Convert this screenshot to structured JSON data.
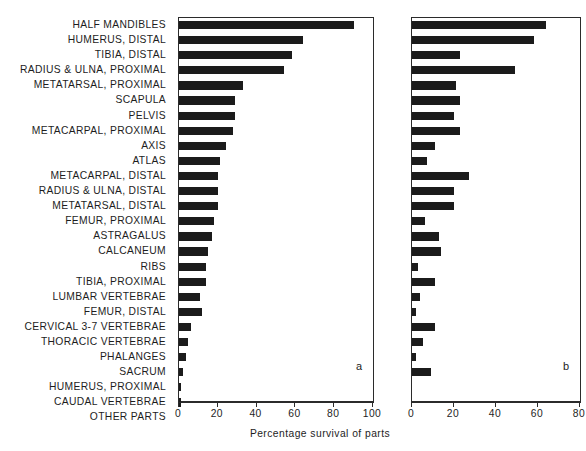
{
  "chart_data": {
    "type": "bar",
    "orientation": "horizontal",
    "title": "",
    "xlabel": "Percentage survival of parts",
    "ylabel": "",
    "grid": false,
    "legend": "none",
    "panels": [
      {
        "tag": "a",
        "xlim": [
          0,
          100
        ],
        "xticks": [
          0,
          20,
          40,
          60,
          80,
          100
        ],
        "xticklabels": [
          "0",
          "20",
          "40",
          "60",
          "80",
          "100"
        ],
        "values": [
          90,
          64,
          58,
          54,
          33,
          29,
          29,
          28,
          24,
          21,
          20,
          20,
          20,
          18,
          17,
          15,
          14,
          14,
          11,
          12,
          6,
          4.5,
          3.5,
          2,
          1,
          1,
          0
        ]
      },
      {
        "tag": "b",
        "xlim": [
          0,
          80
        ],
        "xticks": [
          0,
          20,
          40,
          60,
          80
        ],
        "xticklabels": [
          "0",
          "20",
          "40",
          "60",
          "80"
        ],
        "values": [
          64,
          58,
          23,
          49,
          21,
          23,
          20,
          23,
          11,
          7,
          27,
          20,
          20,
          6,
          13,
          14,
          3,
          11,
          4,
          2,
          11,
          5,
          2,
          9,
          0
        ]
      }
    ],
    "categories": [
      "HALF MANDIBLES",
      "HUMERUS, DISTAL",
      "TIBIA, DISTAL",
      "RADIUS & ULNA, PROXIMAL",
      "METATARSAL, PROXIMAL",
      "SCAPULA",
      "PELVIS",
      "METACARPAL, PROXIMAL",
      "AXIS",
      "ATLAS",
      "METACARPAL, DISTAL",
      "RADIUS & ULNA, DISTAL",
      "METATARSAL, DISTAL",
      "FEMUR, PROXIMAL",
      "ASTRAGALUS",
      "CALCANEUM",
      "RIBS",
      "TIBIA, PROXIMAL",
      "LUMBAR VERTEBRAE",
      "FEMUR, DISTAL",
      "CERVICAL 3-7 VERTEBRAE",
      "THORACIC VERTEBRAE",
      "PHALANGES",
      "SACRUM",
      "HUMERUS, PROXIMAL",
      "CAUDAL VERTEBRAE",
      "OTHER PARTS"
    ],
    "series": [
      {
        "name": "a",
        "values": [
          90,
          64,
          58,
          54,
          33,
          29,
          29,
          28,
          24,
          21,
          20,
          20,
          20,
          18,
          17,
          15,
          14,
          14,
          11,
          12,
          6,
          4.5,
          3.5,
          2,
          1,
          1,
          0
        ]
      },
      {
        "name": "b",
        "values": [
          64,
          58,
          23,
          49,
          21,
          23,
          20,
          23,
          11,
          7,
          27,
          20,
          20,
          6,
          13,
          14,
          3,
          11,
          4,
          2,
          11,
          5,
          2,
          9,
          0,
          0,
          0
        ]
      }
    ]
  },
  "style": {
    "bar_color": "#1b1b1b",
    "axis_color": "#2b2b2b",
    "background": "#ffffff"
  }
}
